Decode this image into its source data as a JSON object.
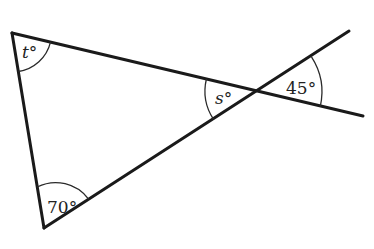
{
  "diagram": {
    "line_color": "#1a1a1a",
    "angles": [
      {
        "id": "t",
        "label": "t°",
        "variable": "t",
        "vertex": "top-left"
      },
      {
        "id": "s",
        "label": "s°",
        "variable": "s",
        "vertex": "intersection"
      },
      {
        "id": "a45",
        "label": "45°",
        "value": 45,
        "vertex": "intersection-right"
      },
      {
        "id": "a70",
        "label": "70°",
        "value": 70,
        "vertex": "bottom"
      }
    ]
  }
}
